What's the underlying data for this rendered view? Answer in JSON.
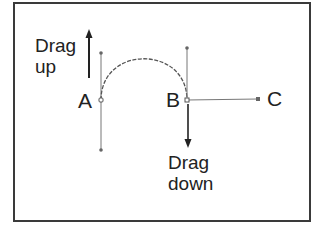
{
  "diagram": {
    "labels": {
      "drag_up_line1": "Drag",
      "drag_up_line2": "up",
      "anchor_a": "A",
      "anchor_b": "B",
      "point_c": "C",
      "drag_down_line1": "Drag",
      "drag_down_line2": "down"
    },
    "colors": {
      "stroke": "#555555",
      "text": "#222222",
      "frame": "#3a3a3a"
    }
  }
}
